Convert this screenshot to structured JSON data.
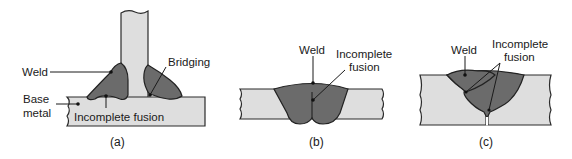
{
  "figure": {
    "colors": {
      "base_metal": "#dedede",
      "weld": "#6b6b6b",
      "outline": "#2a2a2a",
      "text": "#1a1a1a",
      "background": "#ffffff"
    },
    "panel_a": {
      "caption": "(a)",
      "labels": {
        "weld": "Weld",
        "bridging": "Bridging",
        "base_metal_line1": "Base",
        "base_metal_line2": "metal",
        "incomplete_fusion": "Incomplete fusion"
      }
    },
    "panel_b": {
      "caption": "(b)",
      "labels": {
        "weld": "Weld",
        "incomplete_line1": "Incomplete",
        "incomplete_line2": "fusion"
      }
    },
    "panel_c": {
      "caption": "(c)",
      "labels": {
        "weld": "Weld",
        "incomplete_line1": "Incomplete",
        "incomplete_line2": "fusion"
      }
    }
  }
}
